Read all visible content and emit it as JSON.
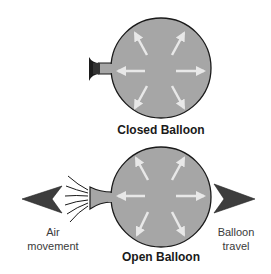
{
  "diagram": {
    "closed_balloon": {
      "label": "Closed Balloon",
      "description": "Pressure arrows pushing equally in all directions; neck tied shut"
    },
    "open_balloon": {
      "label": "Open Balloon",
      "description": "Pressure arrows in all directions; air escapes from open neck"
    },
    "left_label": {
      "line1": "Air",
      "line2": "movement"
    },
    "right_label": {
      "line1": "Balloon",
      "line2": "travel"
    },
    "colors": {
      "balloon_fill": "#a6a6a6",
      "balloon_outline": "#1a1a1a",
      "pressure_arrow": "#e8e8e8",
      "direction_arrow": "#3d3d3d",
      "nozzle_dark": "#1c1c1c"
    }
  }
}
